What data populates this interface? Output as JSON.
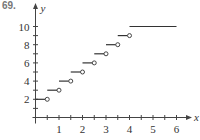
{
  "problem_number": "69.",
  "chart_data": {
    "type": "line",
    "subtype": "step-function",
    "title": "",
    "xlabel": "x",
    "ylabel": "y",
    "xlim": [
      0,
      6.5
    ],
    "ylim": [
      0,
      11
    ],
    "x_ticks": [
      0.5,
      1,
      1.5,
      2,
      2.5,
      3,
      3.5,
      4,
      4.5,
      5,
      5.5,
      6
    ],
    "x_tick_labels": [
      "1",
      "2",
      "3",
      "4",
      "5",
      "6"
    ],
    "y_ticks": [
      1,
      2,
      3,
      4,
      5,
      6,
      7,
      8,
      9,
      10
    ],
    "y_tick_labels": [
      "2",
      "4",
      "6",
      "8",
      "10"
    ],
    "grid": false,
    "segments": [
      {
        "x_start": 0,
        "x_end": 0.5,
        "y": 2,
        "start": "closed",
        "end": "open"
      },
      {
        "x_start": 0.5,
        "x_end": 1,
        "y": 3,
        "start": "closed",
        "end": "open"
      },
      {
        "x_start": 1,
        "x_end": 1.5,
        "y": 4,
        "start": "closed",
        "end": "open"
      },
      {
        "x_start": 1.5,
        "x_end": 2,
        "y": 5,
        "start": "closed",
        "end": "open"
      },
      {
        "x_start": 2,
        "x_end": 2.5,
        "y": 6,
        "start": "closed",
        "end": "open"
      },
      {
        "x_start": 2.5,
        "x_end": 3,
        "y": 7,
        "start": "closed",
        "end": "open"
      },
      {
        "x_start": 3,
        "x_end": 3.5,
        "y": 8,
        "start": "closed",
        "end": "open"
      },
      {
        "x_start": 3.5,
        "x_end": 4,
        "y": 9,
        "start": "closed",
        "end": "open"
      },
      {
        "x_start": 4,
        "x_end": 6,
        "y": 10,
        "start": "closed",
        "end": "closed"
      }
    ],
    "colors": {
      "line": "#333333",
      "axis": "#444444"
    }
  }
}
